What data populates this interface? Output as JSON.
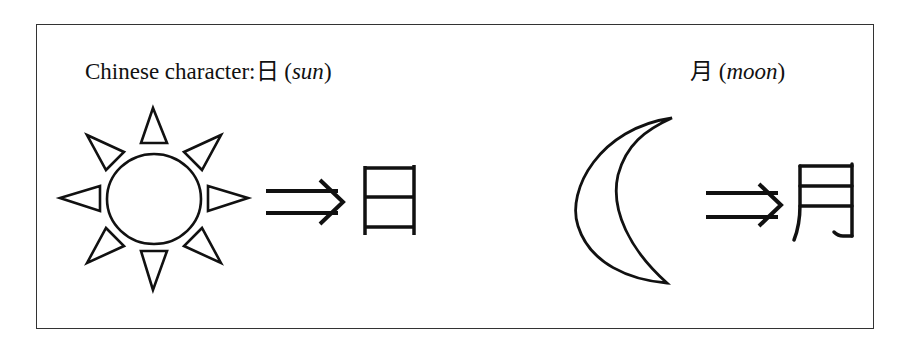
{
  "sun_panel": {
    "caption_prefix": "Chinese character:",
    "character": "日",
    "meaning_open": "(",
    "meaning": "sun",
    "meaning_close": ")",
    "pictograph": "sun-icon",
    "arrow": "⇒"
  },
  "moon_panel": {
    "character": "月",
    "meaning_open": "(",
    "meaning": "moon",
    "meaning_close": ")",
    "pictograph": "crescent-moon-icon",
    "arrow": "⇒"
  },
  "colors": {
    "stroke": "#111111",
    "frame": "#333333",
    "background": "#ffffff"
  }
}
